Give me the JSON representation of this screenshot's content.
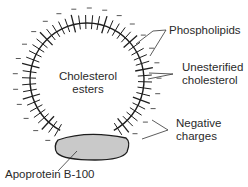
{
  "diagram": {
    "core_label_line1": "Cholesterol",
    "core_label_line2": "esters",
    "labels": {
      "phospholipids": "Phospholipids",
      "unesterified_line1": "Unesterified",
      "unesterified_line2": "cholesterol",
      "negative_line1": "Negative",
      "negative_line2": "charges",
      "apoprotein": "Apoprotein B-100"
    },
    "colors": {
      "line": "#1e1e1e",
      "protein_fill": "#c9c9c9",
      "text": "#2a2a2a"
    }
  }
}
